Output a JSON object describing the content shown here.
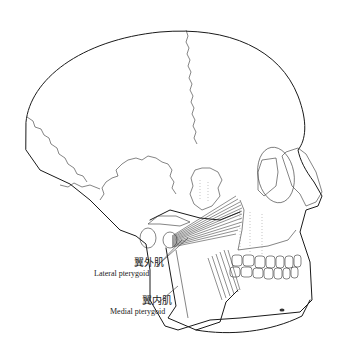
{
  "figure": {
    "labels": [
      {
        "id": "lateral",
        "zh": "翼外肌",
        "en": "Lateral pterygoid"
      },
      {
        "id": "medial",
        "zh": "翼内肌",
        "en": "Medial pterygoid"
      }
    ]
  }
}
